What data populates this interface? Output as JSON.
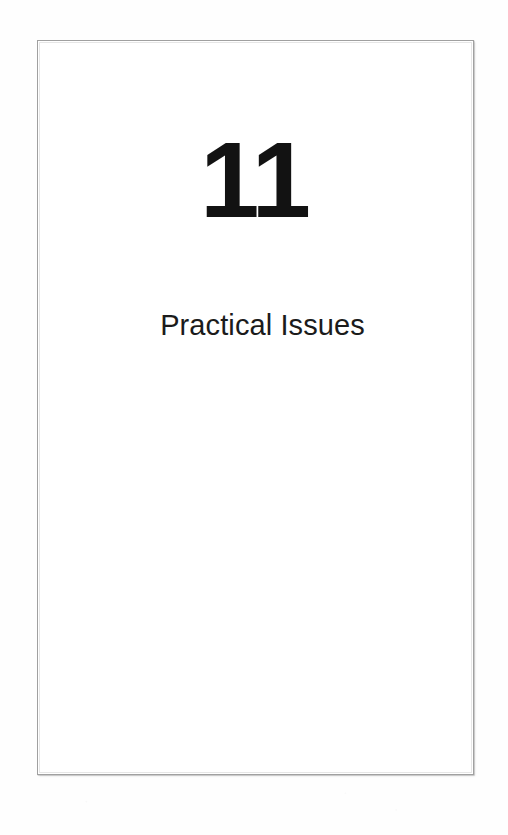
{
  "document": {
    "type": "book-chapter-title-page",
    "background_color": "#fefefe",
    "page": {
      "background_color": "#ffffff",
      "border_color": "#a0a0a0",
      "x": 37,
      "y": 40,
      "width": 437,
      "height": 735
    }
  },
  "chapter": {
    "number": "11",
    "number_color": "#121212",
    "title": "Practical Issues",
    "title_color": "#1b1b1b"
  },
  "body": {
    "content": ""
  }
}
